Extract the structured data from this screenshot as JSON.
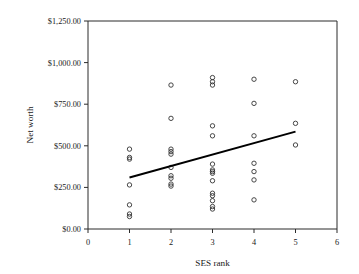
{
  "chart_data": {
    "type": "scatter",
    "title": "",
    "xlabel": "SES rank",
    "ylabel": "Net worth",
    "xlim": [
      0,
      6
    ],
    "ylim": [
      0,
      1250
    ],
    "grid": false,
    "legend": "none",
    "x_ticks": [
      0,
      1,
      2,
      3,
      4,
      5,
      6
    ],
    "x_tick_labels": [
      "0",
      "1",
      "2",
      "3",
      "4",
      "5",
      "6"
    ],
    "y_ticks": [
      0,
      250,
      500,
      750,
      1000,
      1250
    ],
    "y_tick_labels": [
      "$0.00",
      "$250.00",
      "$500.00",
      "$750.00",
      "$1,000.00",
      "$1,250.00"
    ],
    "marker_style": "open-circle",
    "points": [
      {
        "x": 1,
        "y": 480
      },
      {
        "x": 1,
        "y": 430
      },
      {
        "x": 1,
        "y": 420
      },
      {
        "x": 1,
        "y": 265
      },
      {
        "x": 1,
        "y": 145
      },
      {
        "x": 1,
        "y": 90
      },
      {
        "x": 1,
        "y": 75
      },
      {
        "x": 2,
        "y": 865
      },
      {
        "x": 2,
        "y": 665
      },
      {
        "x": 2,
        "y": 480
      },
      {
        "x": 2,
        "y": 465
      },
      {
        "x": 2,
        "y": 450
      },
      {
        "x": 2,
        "y": 370
      },
      {
        "x": 2,
        "y": 320
      },
      {
        "x": 2,
        "y": 305
      },
      {
        "x": 2,
        "y": 270
      },
      {
        "x": 2,
        "y": 258
      },
      {
        "x": 3,
        "y": 910
      },
      {
        "x": 3,
        "y": 885
      },
      {
        "x": 3,
        "y": 865
      },
      {
        "x": 3,
        "y": 620
      },
      {
        "x": 3,
        "y": 560
      },
      {
        "x": 3,
        "y": 390
      },
      {
        "x": 3,
        "y": 355
      },
      {
        "x": 3,
        "y": 345
      },
      {
        "x": 3,
        "y": 335
      },
      {
        "x": 3,
        "y": 290
      },
      {
        "x": 3,
        "y": 215
      },
      {
        "x": 3,
        "y": 200
      },
      {
        "x": 3,
        "y": 170
      },
      {
        "x": 3,
        "y": 135
      },
      {
        "x": 3,
        "y": 120
      },
      {
        "x": 4,
        "y": 900
      },
      {
        "x": 4,
        "y": 755
      },
      {
        "x": 4,
        "y": 560
      },
      {
        "x": 4,
        "y": 395
      },
      {
        "x": 4,
        "y": 345
      },
      {
        "x": 4,
        "y": 295
      },
      {
        "x": 4,
        "y": 175
      },
      {
        "x": 5,
        "y": 885
      },
      {
        "x": 5,
        "y": 635
      },
      {
        "x": 5,
        "y": 505
      }
    ],
    "trendline": {
      "x_start": 1,
      "y_start": 310,
      "x_end": 5,
      "y_end": 585
    }
  }
}
